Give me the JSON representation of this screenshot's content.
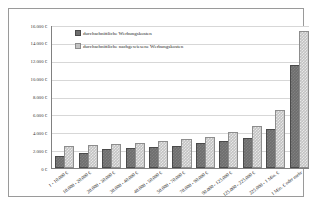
{
  "chart_data": {
    "type": "bar",
    "title": "",
    "xlabel": "",
    "ylabel": "",
    "ylim": [
      0,
      16000
    ],
    "ytick_step": 2000,
    "grid": true,
    "legend_position": "top-left-inside",
    "currency_symbol": "€",
    "yticks": [
      "0 €",
      "2.000 €",
      "4.000 €",
      "6.000 €",
      "8.000 €",
      "10.000 €",
      "12.000 €",
      "14.000 €",
      "16.000 €"
    ],
    "ytick_values": [
      0,
      2000,
      4000,
      6000,
      8000,
      10000,
      12000,
      14000,
      16000
    ],
    "categories": [
      "1 - 10.000 €",
      "10.000 - 20.000 €",
      "20.000 - 30.000 €",
      "30.000 - 40.000 €",
      "40.000 - 50.000 €",
      "50.000 - 70.000 €",
      "70.000 - 90.000 €",
      "90.000 - 125.000 €",
      "125.000 - 225.000 €",
      "225.000 - 1 Mio. €",
      "1 Mio. € oder mehr"
    ],
    "series": [
      {
        "name": "durchschnittliche Werbungskosten",
        "color": "#6e6e6e",
        "values": [
          1100,
          1500,
          1850,
          2000,
          2100,
          2250,
          2550,
          2750,
          3100,
          4150,
          11250
        ]
      },
      {
        "name": "durchschnittliche nachgewiesene Werbungskosten",
        "color": "#c3c3c3",
        "values": [
          2250,
          2300,
          2500,
          2600,
          2750,
          3000,
          3300,
          3750,
          4450,
          6300,
          15100
        ]
      }
    ]
  },
  "legend": {
    "items": [
      {
        "label": "durchschnittliche Werbungskosten"
      },
      {
        "label": "durchschnittliche nachgewiesene Werbungskosten"
      }
    ]
  }
}
